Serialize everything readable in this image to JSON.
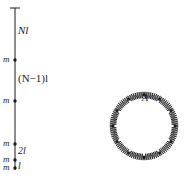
{
  "left_figure": {
    "title": "hanging chain of masses",
    "segment_labels": [
      "Nl",
      "(N−1)l",
      "2l",
      "l"
    ],
    "mass_label": "m",
    "mass_count_visible": 5,
    "ellipsis": "⋮"
  },
  "right_figure": {
    "title": "ring of masses connected by springs",
    "point_label": "A",
    "ellipsis": "…"
  },
  "colors": {
    "ink": "#1a1a1a",
    "background": "#ffffff"
  }
}
